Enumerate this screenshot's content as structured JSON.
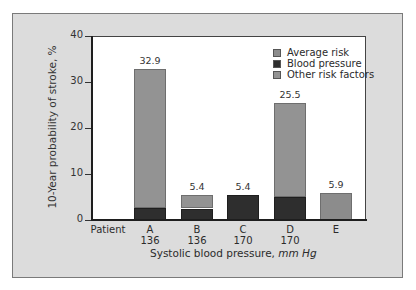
{
  "chart_data": {
    "type": "bar",
    "stacked": true,
    "title": "",
    "xlabel": "Systolic blood pressure,",
    "xlabel_unit": "mm Hg",
    "ylabel": "10-Year probability of stroke, %",
    "ylim": [
      0,
      40
    ],
    "yticks": [
      0,
      10,
      20,
      30,
      40
    ],
    "grid": false,
    "legend_position": "upper right",
    "categories": [
      {
        "label": "Patient",
        "sublabel": ""
      },
      {
        "label": "A",
        "sublabel": "136"
      },
      {
        "label": "B",
        "sublabel": "136"
      },
      {
        "label": "C",
        "sublabel": "170"
      },
      {
        "label": "D",
        "sublabel": "170"
      },
      {
        "label": "E",
        "sublabel": ""
      }
    ],
    "series": [
      {
        "name": "Average risk",
        "color": "#8c8c8c",
        "values": [
          0,
          0,
          0,
          0,
          0,
          5.9
        ]
      },
      {
        "name": "Blood pressure",
        "color": "#2e2e2e",
        "values": [
          0,
          2.7,
          2.5,
          5.4,
          5.0,
          0
        ]
      },
      {
        "name": "Other risk factors",
        "color": "#939393",
        "values": [
          0,
          30.2,
          2.9,
          0,
          20.5,
          0
        ]
      }
    ],
    "totals": [
      "",
      "32.9",
      "5.4",
      "5.4",
      "25.5",
      "5.9"
    ]
  }
}
